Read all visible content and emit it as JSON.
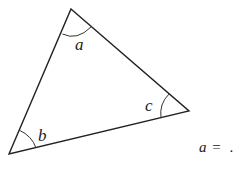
{
  "diagram": {
    "type": "triangle",
    "vertices": {
      "top": [
        71,
        9
      ],
      "right": [
        189,
        111
      ],
      "bottom_left": [
        9,
        154
      ]
    },
    "angle_labels": {
      "top": "a",
      "right": "c",
      "bottom_left": "b"
    },
    "line_color": "#222222"
  },
  "equation": {
    "variable": "a",
    "operator": "=",
    "blank": " ",
    "terminator": "."
  }
}
